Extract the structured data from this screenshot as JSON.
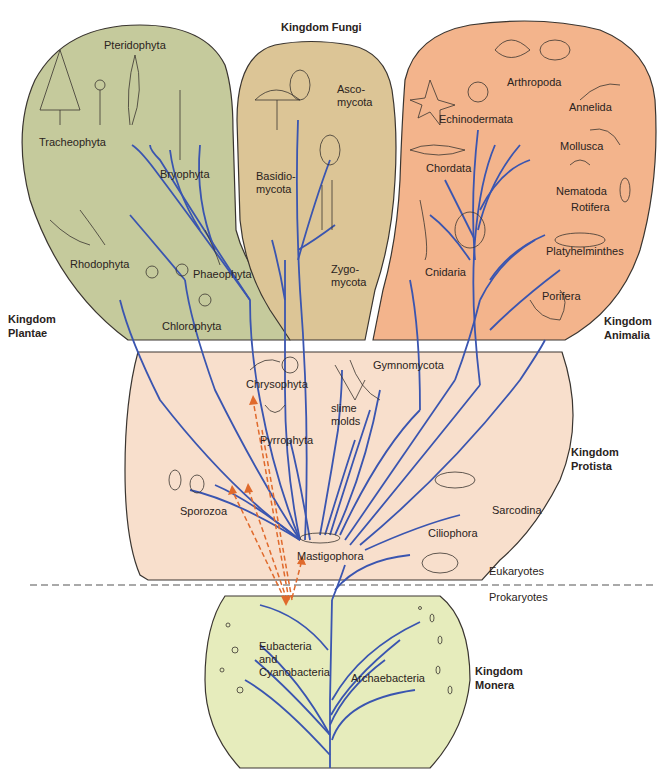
{
  "colors": {
    "plantae_fill": "#c5ca9c",
    "fungi_fill": "#dcc596",
    "animalia_fill": "#f3b48c",
    "protista_fill": "#f8dfcc",
    "monera_fill": "#e6ecbc",
    "branch": "#3a55b0",
    "endosymbiosis_arrow": "#e06a2c",
    "outline": "#3a3530"
  },
  "divider": {
    "upper_label": "Eukaryotes",
    "lower_label": "Prokaryotes"
  },
  "kingdoms": {
    "plantae": {
      "label": "Kingdom\nPlantae",
      "groups": [
        "Tracheophyta",
        "Pteridophyta",
        "Bryophyta",
        "Rhodophyta",
        "Phaeophyta",
        "Chlorophyta"
      ]
    },
    "fungi": {
      "label": "Kingdom Fungi",
      "groups": [
        "Asco-\nmycota",
        "Basidio-\nmycota",
        "Zygo-\nmycota"
      ]
    },
    "animalia": {
      "label": "Kingdom\nAnimalia",
      "groups": [
        "Arthropoda",
        "Echinodermata",
        "Annelida",
        "Mollusca",
        "Chordata",
        "Nematoda",
        "Rotifera",
        "Platyhelminthes",
        "Cnidaria",
        "Porifera"
      ]
    },
    "protista": {
      "label": "Kingdom\nProtista",
      "groups": [
        "Chrysophyta",
        "Gymnomycota",
        "slime\nmolds",
        "Pyrrophyta",
        "Sporozoa",
        "Sarcodina",
        "Ciliophora",
        "Mastigophora"
      ]
    },
    "monera": {
      "label": "Kingdom\nMonera",
      "groups": [
        "Eubacteria\nand\nCyanobacteria",
        "Archaebacteria"
      ]
    }
  }
}
